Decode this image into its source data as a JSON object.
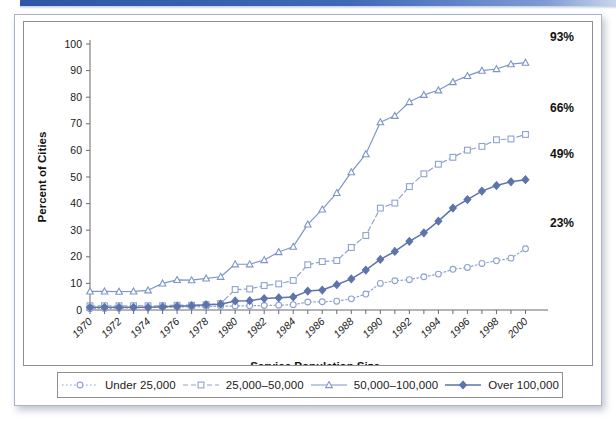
{
  "page": {
    "background_color": "#ffffff",
    "top_rule_color": "#2f56a6",
    "card_border_color": "#a9b4cc"
  },
  "colors": {
    "series_light": "#8ea3cf",
    "series_mid": "#7e95c6",
    "series_dark": "#5d74ab",
    "axis": "#6b6b6b",
    "text": "#1a1a1a"
  },
  "axis": {
    "y_title": "Percent of Cities",
    "x_title": "Service Population Size",
    "y_ticks": [
      0,
      10,
      20,
      30,
      40,
      50,
      60,
      70,
      80,
      90,
      100
    ],
    "y_min": 0,
    "y_max": 100,
    "x_ticks": [
      1970,
      1972,
      1974,
      1976,
      1978,
      1980,
      1982,
      1984,
      1986,
      1988,
      1990,
      1992,
      1994,
      1996,
      1998,
      2000
    ],
    "x_min": 1970,
    "x_max": 2001
  },
  "end_labels": [
    {
      "text": "93%",
      "series": "50,000–100,000"
    },
    {
      "text": "66%",
      "series": "25,000–50,000"
    },
    {
      "text": "49%",
      "series": "Over 100,000"
    },
    {
      "text": "23%",
      "series": "Under 25,000"
    }
  ],
  "legend": {
    "items": [
      {
        "label": "Under 25,000",
        "marker": "open-circle",
        "dash": "dotted",
        "color": "#8ea3cf"
      },
      {
        "label": "25,000–50,000",
        "marker": "open-square",
        "dash": "dashed",
        "color": "#8ea3cf"
      },
      {
        "label": "50,000–100,000",
        "marker": "open-triangle",
        "dash": "solid",
        "color": "#7e95c6"
      },
      {
        "label": "Over 100,000",
        "marker": "filled-diamond",
        "dash": "solid",
        "color": "#5d74ab"
      }
    ]
  },
  "chart_data": {
    "type": "line",
    "title": "",
    "xlabel": "Service Population Size",
    "ylabel": "Percent of Cities",
    "xlim": [
      1970,
      2001
    ],
    "ylim": [
      0,
      100
    ],
    "grid": false,
    "legend_position": "bottom",
    "x": [
      1970,
      1971,
      1972,
      1973,
      1974,
      1975,
      1976,
      1977,
      1978,
      1979,
      1980,
      1981,
      1982,
      1983,
      1984,
      1985,
      1986,
      1987,
      1988,
      1989,
      1990,
      1991,
      1992,
      1993,
      1994,
      1995,
      1996,
      1997,
      1998,
      1999,
      2000
    ],
    "series": [
      {
        "name": "Under 25,000",
        "marker": "open-circle",
        "dash": "dotted",
        "color": "#8ea3cf",
        "end_label": "23%",
        "values": [
          0.5,
          0.6,
          0.7,
          0.8,
          0.9,
          1.0,
          1.1,
          1.2,
          1.3,
          1.4,
          1.5,
          1.6,
          1.7,
          1.8,
          2.0,
          3.0,
          3.1,
          3.3,
          4.2,
          6.0,
          10.0,
          11.0,
          11.4,
          12.5,
          13.5,
          15.3,
          16.0,
          17.5,
          18.5,
          19.5,
          23.0
        ]
      },
      {
        "name": "25,000–50,000",
        "marker": "open-square",
        "dash": "dashed",
        "color": "#8ea3cf",
        "end_label": "66%",
        "values": [
          1.6,
          1.6,
          1.6,
          1.6,
          1.6,
          1.6,
          1.8,
          1.8,
          2.0,
          2.4,
          7.7,
          7.9,
          9.2,
          9.8,
          11.1,
          17.0,
          18.2,
          18.6,
          23.5,
          28.0,
          38.3,
          40.2,
          46.4,
          51.2,
          54.8,
          57.4,
          60.1,
          61.5,
          64.0,
          64.3,
          66.0
        ]
      },
      {
        "name": "50,000–100,000",
        "marker": "open-triangle",
        "dash": "solid",
        "color": "#7e95c6",
        "end_label": "93%",
        "values": [
          7.0,
          7.0,
          6.9,
          7.0,
          7.4,
          10.0,
          11.3,
          11.2,
          11.9,
          12.5,
          17.2,
          17.2,
          18.8,
          21.8,
          23.8,
          32.2,
          37.8,
          44.0,
          51.8,
          58.6,
          70.6,
          73.0,
          78.2,
          80.9,
          82.6,
          85.7,
          88.0,
          90.0,
          90.6,
          92.4,
          93.0
        ]
      },
      {
        "name": "Over 100,000",
        "marker": "filled-diamond",
        "dash": "solid",
        "color": "#5d74ab",
        "end_label": "49%",
        "values": [
          1.0,
          1.0,
          1.0,
          1.0,
          1.0,
          1.2,
          1.4,
          1.6,
          2.0,
          2.2,
          3.4,
          3.5,
          4.3,
          4.6,
          4.9,
          7.1,
          7.5,
          9.5,
          11.7,
          15.0,
          19.0,
          22.0,
          25.8,
          29.0,
          33.4,
          38.3,
          41.5,
          44.7,
          46.8,
          48.2,
          49.0
        ]
      }
    ]
  }
}
